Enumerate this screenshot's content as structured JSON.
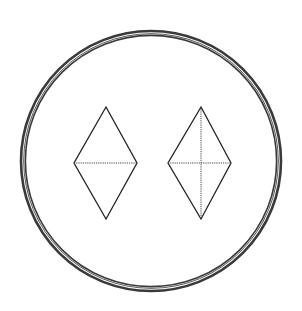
{
  "figure": {
    "width": 302,
    "height": 311,
    "background": "#ffffff",
    "stroke_color": "#222222",
    "ring": {
      "cx": 151,
      "cy": 161,
      "rings": [
        {
          "r": 130,
          "width": 2.6,
          "color": "#3a3a3a"
        },
        {
          "r": 127.3,
          "width": 1.0,
          "color": "#555555"
        },
        {
          "r": 125.6,
          "width": 1.6,
          "color": "#3a3a3a"
        }
      ]
    },
    "shapes": [
      {
        "name": "left-rhombus",
        "top": [
          106,
          107
        ],
        "right": [
          137,
          163
        ],
        "bottom": [
          106,
          219
        ],
        "left": [
          74,
          163
        ],
        "dashed_diagonals": [
          "horizontal"
        ]
      },
      {
        "name": "right-rhombus",
        "top": [
          201,
          107
        ],
        "right": [
          231,
          163
        ],
        "bottom": [
          201,
          219
        ],
        "left": [
          168,
          163
        ],
        "dashed_diagonals": [
          "horizontal",
          "vertical"
        ]
      }
    ]
  }
}
